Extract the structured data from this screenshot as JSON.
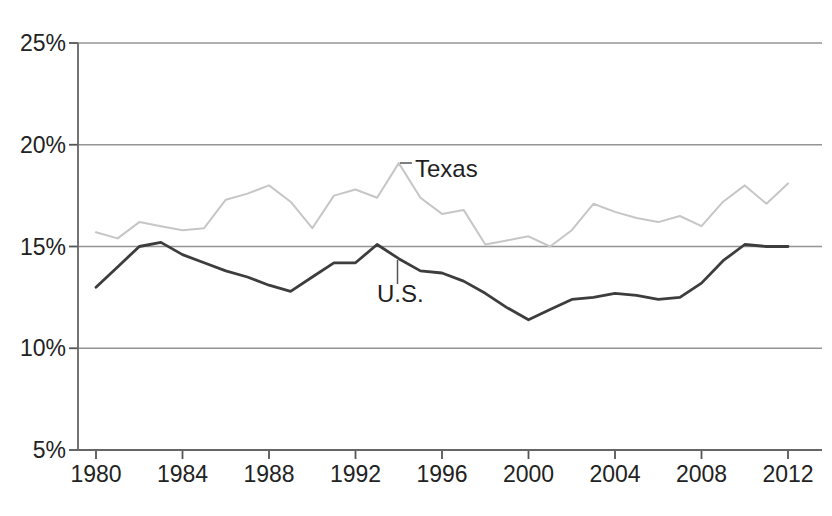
{
  "chart_data": {
    "type": "line",
    "title": "",
    "xlabel": "",
    "ylabel": "",
    "x": [
      1980,
      1981,
      1982,
      1983,
      1984,
      1985,
      1986,
      1987,
      1988,
      1989,
      1990,
      1991,
      1992,
      1993,
      1994,
      1995,
      1996,
      1997,
      1998,
      1999,
      2000,
      2001,
      2002,
      2003,
      2004,
      2005,
      2006,
      2007,
      2008,
      2009,
      2010,
      2011,
      2012
    ],
    "series": [
      {
        "name": "Texas",
        "color": "#c6c6c6",
        "width": 2,
        "values": [
          15.7,
          15.4,
          16.2,
          16.0,
          15.8,
          15.9,
          17.3,
          17.6,
          18.0,
          17.2,
          15.9,
          17.5,
          17.8,
          17.4,
          19.1,
          17.4,
          16.6,
          16.8,
          15.1,
          15.3,
          15.5,
          15.0,
          15.8,
          17.1,
          16.7,
          16.4,
          16.2,
          16.5,
          16.0,
          17.2,
          18.0,
          17.1,
          18.1
        ]
      },
      {
        "name": "U.S.",
        "color": "#3d3d3d",
        "width": 2.8,
        "values": [
          13.0,
          14.0,
          15.0,
          15.2,
          14.6,
          14.2,
          13.8,
          13.5,
          13.1,
          12.8,
          13.5,
          14.2,
          14.2,
          15.1,
          14.4,
          13.8,
          13.7,
          13.3,
          12.7,
          12.0,
          11.4,
          11.9,
          12.4,
          12.5,
          12.7,
          12.6,
          12.4,
          12.5,
          13.2,
          14.3,
          15.1,
          15.0,
          15.0
        ]
      }
    ],
    "ylim": [
      5,
      25
    ],
    "xlim": [
      1980,
      2012
    ],
    "y_ticks": [
      5,
      10,
      15,
      20,
      25
    ],
    "y_tick_labels": [
      "5%",
      "10%",
      "15%",
      "20%",
      "25%"
    ],
    "x_ticks": [
      1980,
      1984,
      1988,
      1992,
      1996,
      2000,
      2004,
      2008,
      2012
    ],
    "x_tick_labels": [
      "1980",
      "1984",
      "1988",
      "1992",
      "1996",
      "2000",
      "2004",
      "2008",
      "2012"
    ],
    "grid": "horizontal",
    "legend_position": "inline-annotations",
    "annotations": [
      {
        "text": "Texas",
        "series": "Texas",
        "year": 1994,
        "value": 19.1
      },
      {
        "text": "U.S.",
        "series": "U.S.",
        "year": 1994,
        "value": 14.4
      }
    ],
    "colors": {
      "background": "#ffffff",
      "gridline": "#949494",
      "axis": "#666666",
      "tick": "#555555",
      "label": "#222222"
    }
  }
}
